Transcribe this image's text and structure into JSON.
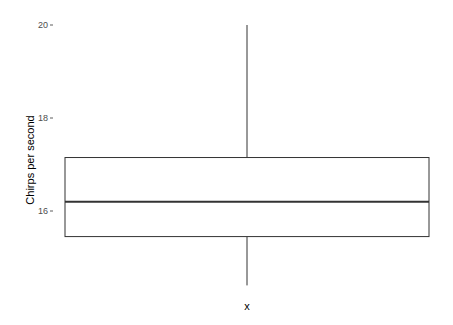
{
  "chart_data": {
    "type": "boxplot",
    "title": "",
    "xlabel": "x",
    "ylabel": "Chirps per second",
    "ylim": [
      14.2,
      20.1
    ],
    "yticks": [
      16,
      18,
      20
    ],
    "ytick_labels": [
      "16",
      "18",
      "20"
    ],
    "grid": false,
    "legend": null,
    "boxes": [
      {
        "category": "",
        "whisker_low": 14.4,
        "q1": 15.45,
        "median": 16.2,
        "q3": 17.15,
        "whisker_high": 20.0
      }
    ]
  },
  "colors": {
    "background": "#ffffff",
    "box_fill": "#ffffff",
    "box_stroke": "#333333",
    "tick_text": "#4d4d4d"
  }
}
